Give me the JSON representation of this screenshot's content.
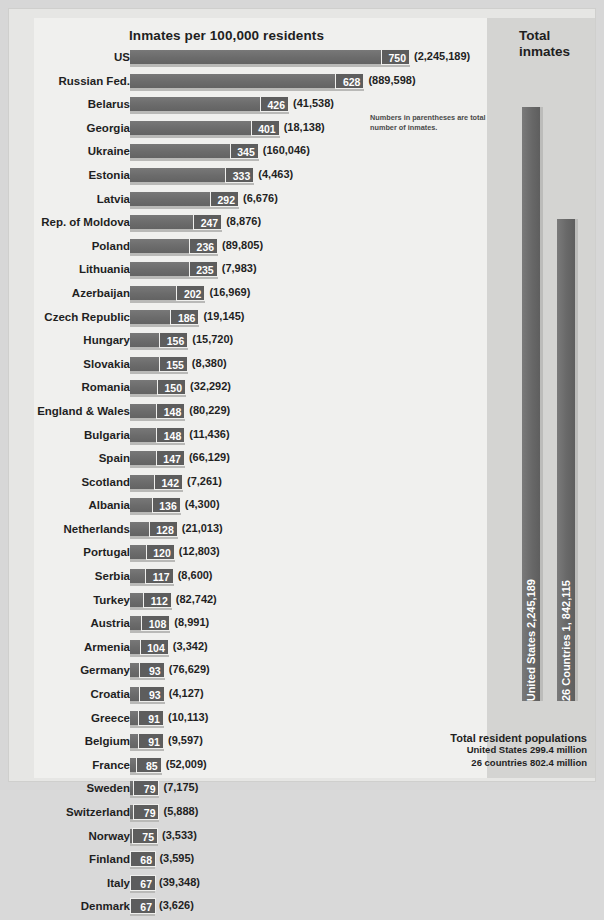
{
  "header": {
    "chart_title": "Inmates per 100,000 residents",
    "totals_title_line1": "Total",
    "totals_title_line2": "inmates"
  },
  "note": "Numbers in parentheses are total number of inmates.",
  "totals": {
    "us_bar_label": "United States 2,245,189",
    "countries_bar_label": "26 Countries 1, 842,115",
    "footer_heading": "Total resident populations",
    "footer_line1": "United States 299.4 million",
    "footer_line2": "26 countries 802.4 million"
  },
  "colors": {
    "bar": "#6b6b6b",
    "bar_shadow": "#b9b9b7",
    "value_box": "#5d5d5d",
    "panel_light": "#f0f0ee",
    "panel_gray": "#d4d4d2",
    "page_bg": "#d7d7d7"
  },
  "chart_data": {
    "type": "bar",
    "orientation": "horizontal",
    "title": "Inmates per 100,000 residents",
    "xlabel": "Inmates per 100,000 residents",
    "ylabel": "",
    "xlim": [
      0,
      750
    ],
    "grid": false,
    "legend": false,
    "annotations": [
      "Numbers in parentheses are total number of inmates.",
      "Total resident populations",
      "United States 299.4 million",
      "26 countries 802.4 million"
    ],
    "categories": [
      "US",
      "Russian Fed.",
      "Belarus",
      "Georgia",
      "Ukraine",
      "Estonia",
      "Latvia",
      "Rep. of Moldova",
      "Poland",
      "Lithuania",
      "Azerbaijan",
      "Czech Republic",
      "Hungary",
      "Slovakia",
      "Romania",
      "England & Wales",
      "Bulgaria",
      "Spain",
      "Scotland",
      "Albania",
      "Netherlands",
      "Portugal",
      "Serbia",
      "Turkey",
      "Austria",
      "Armenia",
      "Germany",
      "Croatia",
      "Greece",
      "Belgium",
      "France",
      "Sweden",
      "Switzerland",
      "Norway",
      "Finland",
      "Italy",
      "Denmark"
    ],
    "values": [
      750,
      628,
      426,
      401,
      345,
      333,
      292,
      247,
      236,
      235,
      202,
      186,
      156,
      155,
      150,
      148,
      148,
      147,
      142,
      136,
      128,
      120,
      117,
      112,
      108,
      104,
      93,
      93,
      91,
      91,
      85,
      79,
      79,
      75,
      68,
      67,
      67
    ],
    "totals_labels": [
      "(2,245,189)",
      "(889,598)",
      "(41,538)",
      "(18,138)",
      "(160,046)",
      "(4,463)",
      "(6,676)",
      "(8,876)",
      "(89,805)",
      "(7,983)",
      "(16,969)",
      "(19,145)",
      "(15,720)",
      "(8,380)",
      "(32,292)",
      "(80,229)",
      "(11,436)",
      "(66,129)",
      "(7,261)",
      "(4,300)",
      "(21,013)",
      "(12,803)",
      "(8,600)",
      "(82,742)",
      "(8,991)",
      "(3,342)",
      "(76,629)",
      "(4,127)",
      "(10,113)",
      "(9,597)",
      "(52,009)",
      "(7,175)",
      "(5,888)",
      "(3,533)",
      "(3,595)",
      "(39,348)",
      "(3,626)"
    ],
    "secondary_chart": {
      "type": "bar",
      "orientation": "vertical",
      "title": "Total inmates",
      "categories": [
        "United States",
        "26 Countries"
      ],
      "values": [
        2245189,
        1842115
      ],
      "value_labels": [
        "United States 2,245,189",
        "26 Countries 1, 842,115"
      ]
    }
  }
}
